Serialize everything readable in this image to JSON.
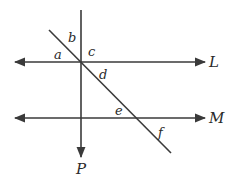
{
  "diagram": {
    "lines": {
      "L": {
        "label": "L",
        "y": 62,
        "x1": 15,
        "x2": 205
      },
      "M": {
        "label": "M",
        "y": 118,
        "x1": 15,
        "x2": 205
      },
      "P": {
        "label": "P",
        "x": 81,
        "y1": 10,
        "y2": 157
      },
      "transversal": {
        "x1": 49,
        "y1": 30,
        "x2": 171,
        "y2": 153
      }
    },
    "angles": [
      {
        "label": "a",
        "x": 58,
        "y": 57
      },
      {
        "label": "b",
        "x": 70,
        "y": 41
      },
      {
        "label": "c",
        "x": 88,
        "y": 55
      },
      {
        "label": "d",
        "x": 100,
        "y": 78
      },
      {
        "label": "e",
        "x": 116,
        "y": 114
      },
      {
        "label": "f",
        "x": 159,
        "y": 136
      }
    ],
    "colors": {
      "stroke": "#3a3a3a",
      "text": "#2a2a2a"
    }
  }
}
